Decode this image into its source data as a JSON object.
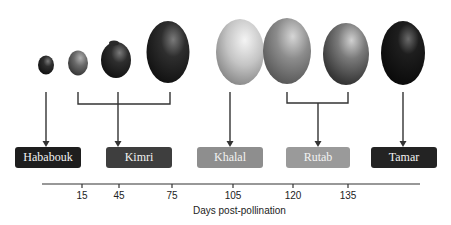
{
  "stages": [
    {
      "label": "Hababouk",
      "color": "#1e1e1e",
      "x": 15,
      "w": 66
    },
    {
      "label": "Kimri",
      "color": "#3e3e3e",
      "x": 106,
      "w": 66
    },
    {
      "label": "Khalal",
      "color": "#8e8e8e",
      "x": 197,
      "w": 66
    },
    {
      "label": "Rutab",
      "color": "#9a9a9a",
      "x": 286,
      "w": 64
    },
    {
      "label": "Tamar",
      "color": "#232323",
      "x": 371,
      "w": 66
    }
  ],
  "axis": {
    "title": "Days post-pollination",
    "ticks": [
      "15",
      "45",
      "75",
      "105",
      "120",
      "135"
    ]
  },
  "fruits": [
    {
      "name": "fruit-1",
      "stage": "Hababouk"
    },
    {
      "name": "fruit-2",
      "stage": "Kimri"
    },
    {
      "name": "fruit-3",
      "stage": "Kimri"
    },
    {
      "name": "fruit-4",
      "stage": "Kimri"
    },
    {
      "name": "fruit-5",
      "stage": "Khalal"
    },
    {
      "name": "fruit-6",
      "stage": "Rutab"
    },
    {
      "name": "fruit-7",
      "stage": "Rutab"
    },
    {
      "name": "fruit-8",
      "stage": "Tamar"
    }
  ]
}
